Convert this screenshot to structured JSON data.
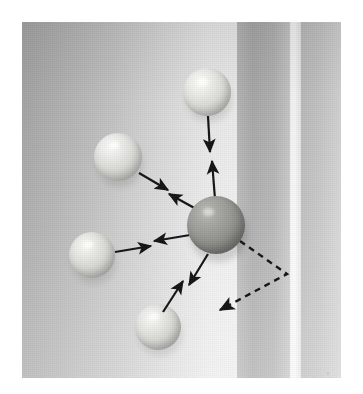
{
  "figure": {
    "kind": "photograph",
    "background_color": "#ffffff",
    "photo": {
      "x": 22,
      "y": 22,
      "width": 319,
      "height": 356
    }
  },
  "background_bands": [
    {
      "name": "wall-gradient-left",
      "x": 0,
      "width": 215,
      "from": "#a9a9a9",
      "to": "#eeeeee"
    },
    {
      "name": "wall-band-mid",
      "x": 215,
      "width": 53,
      "from": "#b0b0b0",
      "to": "#cfcfcf"
    },
    {
      "name": "wall-highlight-seam",
      "x": 268,
      "width": 10,
      "from": "#f2f2f2",
      "to": "#e2e2e2"
    },
    {
      "name": "wall-band-right",
      "x": 278,
      "width": 41,
      "from": "#c2c2c2",
      "to": "#d8d8d8"
    }
  ],
  "spheres": [
    {
      "name": "sphere-top",
      "cx": 185,
      "cy": 70,
      "r": 24,
      "tone": "light",
      "base_color": "#d7d7d5",
      "highlight": "#f3f3f0"
    },
    {
      "name": "sphere-upper-left",
      "cx": 96,
      "cy": 135,
      "r": 24,
      "tone": "light",
      "base_color": "#d5d5d3",
      "highlight": "#f1f1ee"
    },
    {
      "name": "sphere-left",
      "cx": 70,
      "cy": 233,
      "r": 23,
      "tone": "light",
      "base_color": "#d2d2d0",
      "highlight": "#efefec"
    },
    {
      "name": "sphere-bottom",
      "cx": 136,
      "cy": 305,
      "r": 23,
      "tone": "light",
      "base_color": "#d3d3d1",
      "highlight": "#f0f0ed"
    },
    {
      "name": "sphere-center",
      "cx": 194,
      "cy": 203,
      "r": 29,
      "tone": "dark",
      "base_color": "#8e8e8c",
      "highlight": "#b9b9b6"
    }
  ],
  "arrows": [
    {
      "name": "arrow-pair-top",
      "style": "solid",
      "from": "sphere-top",
      "to": "sphere-center",
      "double_headed": true
    },
    {
      "name": "arrow-pair-upper-left",
      "style": "solid",
      "from": "sphere-upper-left",
      "to": "sphere-center",
      "double_headed": true
    },
    {
      "name": "arrow-pair-left",
      "style": "solid",
      "from": "sphere-left",
      "to": "sphere-center",
      "double_headed": true
    },
    {
      "name": "arrow-pair-bottom",
      "style": "solid",
      "from": "sphere-bottom",
      "to": "sphere-center",
      "double_headed": true
    }
  ],
  "dashed_path": {
    "name": "dashed-reflection-arrow",
    "style": "dashed",
    "points": [
      {
        "x": 218,
        "y": 219
      },
      {
        "x": 265,
        "y": 252
      },
      {
        "x": 198,
        "y": 288
      }
    ],
    "arrowhead_at": "end",
    "color": "#141414",
    "dash": "6 5"
  },
  "colors": {
    "ink": "#141414",
    "sphere_light": "#d5d5d3",
    "sphere_dark": "#8e8e8c",
    "page": "#ffffff"
  }
}
